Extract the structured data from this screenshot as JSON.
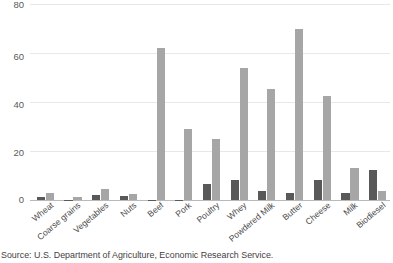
{
  "chart_data": {
    "type": "bar",
    "title": "",
    "subtitle": "",
    "xlabel": "",
    "ylabel": "",
    "ylim": [
      0,
      80
    ],
    "yticks": [
      0,
      20,
      40,
      60,
      80
    ],
    "grid": true,
    "legend": "none",
    "categories": [
      "Wheat",
      "Coarse grains",
      "Vegetables",
      "Nuts",
      "Beef",
      "Pork",
      "Poultry",
      "Whey",
      "Powdered Milk",
      "Butter",
      "Cheese",
      "Milk",
      "Biodiesel"
    ],
    "series": [
      {
        "name": "dark-series",
        "color": "#595959",
        "values": [
          1.2,
          0.2,
          2.0,
          1.7,
          0.2,
          0.2,
          6.5,
          8.0,
          3.8,
          2.8,
          8.2,
          3.0,
          12.2
        ]
      },
      {
        "name": "light-series",
        "color": "#a6a6a6",
        "values": [
          3.0,
          1.2,
          4.4,
          2.3,
          61.0,
          28.5,
          24.5,
          53.0,
          44.3,
          68.3,
          41.8,
          13.0,
          3.5
        ]
      }
    ]
  },
  "axis": {
    "ytick_labels": [
      "80",
      "60",
      "40",
      "20",
      "0"
    ]
  },
  "source": {
    "text": "Source: U.S. Department of Agriculture, Economic Research Service."
  },
  "colors": {
    "dark_bar": "#595959",
    "light_bar": "#a6a6a6",
    "gridline": "#e8e8e8",
    "axis": "#b9b9b9",
    "tick_text": "#5a5a5a",
    "label_text": "#4a4a4a",
    "source_text": "#3f3f3f",
    "background": "#ffffff"
  }
}
